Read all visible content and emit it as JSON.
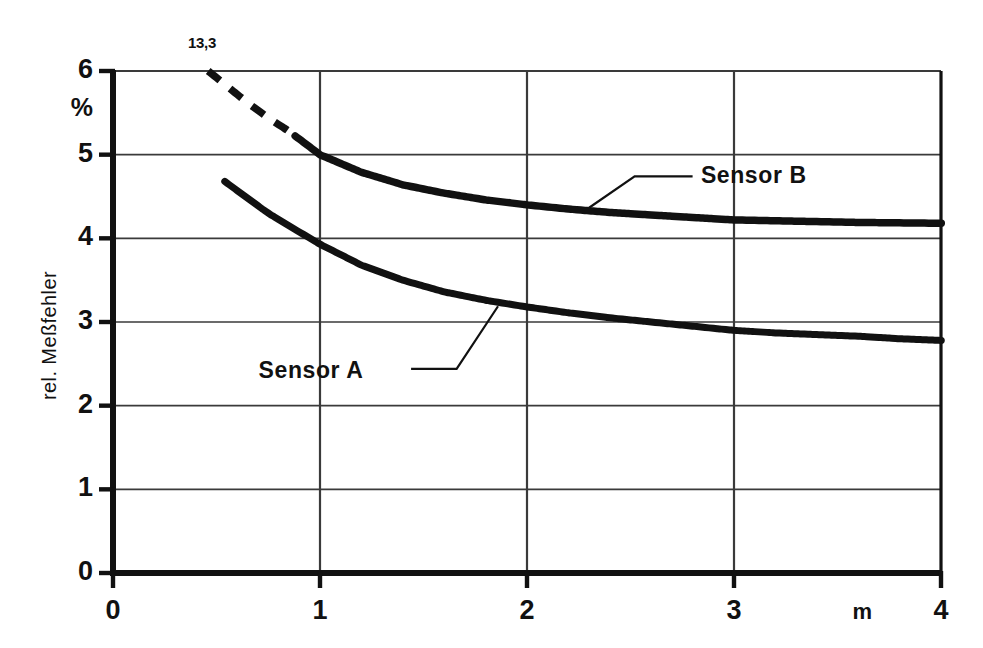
{
  "chart_data": {
    "type": "line",
    "title": "",
    "xlabel": "m",
    "ylabel": "rel. Meßfehler",
    "yunit": "%",
    "xlim": [
      0,
      4
    ],
    "ylim": [
      0,
      6
    ],
    "xticks": [
      "0",
      "1",
      "2",
      "3",
      "4"
    ],
    "yticks": [
      "0",
      "1",
      "2",
      "3",
      "4",
      "5",
      "6"
    ],
    "grid": true,
    "legend_position": "inline-annotations",
    "annotations": [
      {
        "name": "peak-value",
        "text": "13,3",
        "x": 0.46,
        "y": 6.0
      }
    ],
    "series": [
      {
        "name": "Sensor B",
        "label": "Sensor B",
        "color": "#111111",
        "x": [
          0.46,
          0.55,
          0.65,
          0.75,
          0.85,
          1.0,
          1.2,
          1.4,
          1.6,
          1.8,
          2.0,
          2.2,
          2.4,
          2.6,
          2.8,
          3.0,
          3.2,
          3.4,
          3.6,
          3.8,
          4.0
        ],
        "y": [
          6.0,
          5.82,
          5.62,
          5.44,
          5.28,
          5.0,
          4.79,
          4.64,
          4.54,
          4.46,
          4.4,
          4.35,
          4.31,
          4.28,
          4.25,
          4.22,
          4.21,
          4.2,
          4.19,
          4.185,
          4.18
        ],
        "dash_until_x": 0.88,
        "label_x": 2.62,
        "label_y": 4.72
      },
      {
        "name": "Sensor A",
        "label": "Sensor A",
        "color": "#111111",
        "x": [
          0.54,
          0.65,
          0.75,
          0.85,
          1.0,
          1.2,
          1.4,
          1.6,
          1.8,
          2.0,
          2.2,
          2.4,
          2.6,
          2.8,
          3.0,
          3.2,
          3.4,
          3.6,
          3.8,
          4.0
        ],
        "y": [
          4.68,
          4.48,
          4.3,
          4.15,
          3.93,
          3.68,
          3.5,
          3.36,
          3.26,
          3.18,
          3.11,
          3.05,
          3.0,
          2.95,
          2.9,
          2.87,
          2.85,
          2.83,
          2.8,
          2.78
        ],
        "dash_until_x": 0,
        "label_x": 1.08,
        "label_y": 2.42
      }
    ]
  },
  "axis": {
    "y_title": "rel. Meßfehler",
    "y_unit_label": "%",
    "x_unit_label": "m"
  },
  "labels": {
    "peak": "13,3",
    "sensor_a": "Sensor A",
    "sensor_b": "Sensor B"
  },
  "colors": {
    "ink": "#111111",
    "grid": "#3a3a3a",
    "background": "#ffffff"
  }
}
